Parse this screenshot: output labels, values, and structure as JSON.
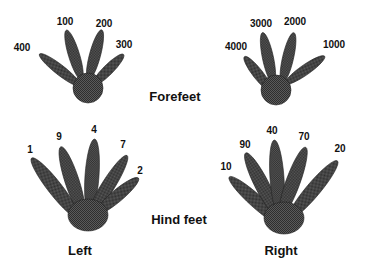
{
  "labels": {
    "forefeet": "Forefeet",
    "hind_feet": "Hind feet",
    "left": "Left",
    "right": "Right"
  },
  "fill_color": "#4a4a4a",
  "feet": {
    "left_fore": {
      "toes": [
        {
          "label": "400",
          "x": 22,
          "y": 48
        },
        {
          "label": "100",
          "x": 65,
          "y": 22
        },
        {
          "label": "200",
          "x": 104,
          "y": 24
        },
        {
          "label": "300",
          "x": 127,
          "y": 44
        }
      ]
    },
    "right_fore": {
      "toes": [
        {
          "label": "4000",
          "x": 236,
          "y": 47
        },
        {
          "label": "3000",
          "x": 261,
          "y": 24
        },
        {
          "label": "2000",
          "x": 295,
          "y": 22
        },
        {
          "label": "1000",
          "x": 333,
          "y": 45
        }
      ]
    },
    "left_hind": {
      "toes": [
        {
          "label": "1",
          "x": 30,
          "y": 148
        },
        {
          "label": "9",
          "x": 59,
          "y": 137
        },
        {
          "label": "4",
          "x": 94,
          "y": 130
        },
        {
          "label": "7",
          "x": 123,
          "y": 145
        },
        {
          "label": "2",
          "x": 140,
          "y": 170
        }
      ]
    },
    "right_hind": {
      "toes": [
        {
          "label": "10",
          "x": 226,
          "y": 165
        },
        {
          "label": "90",
          "x": 244,
          "y": 145
        },
        {
          "label": "40",
          "x": 272,
          "y": 131
        },
        {
          "label": "70",
          "x": 303,
          "y": 137
        },
        {
          "label": "20",
          "x": 340,
          "y": 148
        }
      ]
    }
  }
}
